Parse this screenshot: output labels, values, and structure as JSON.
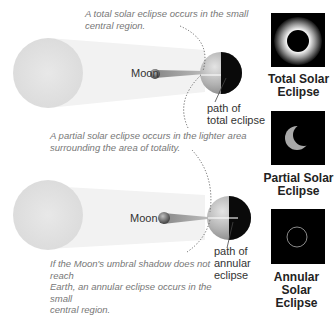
{
  "panels": [
    {
      "id": "total",
      "caption": "A total solar eclipse occurs in the small central region.",
      "caption_lines": [
        "A total solar eclipse occurs in the small",
        "central region."
      ],
      "moon_label": "Moon",
      "path_label_lines": [
        "path of",
        "total eclipse"
      ],
      "photo_title_lines": [
        "Total Solar",
        "Eclipse"
      ]
    },
    {
      "id": "partial",
      "caption": "A partial solar eclipse occurs in the lighter area surrounding the area of totality.",
      "caption_lines": [
        "A partial solar eclipse occurs in the lighter area",
        "surrounding the area of totality."
      ],
      "photo_title_lines": [
        "Partial Solar",
        "Eclipse"
      ]
    },
    {
      "id": "annular",
      "caption": "If the Moon's umbral shadow does not reach Earth, an annular eclipse occurs in the small central region.",
      "caption_lines": [
        "If the Moon's umbral shadow does not reach",
        "Earth, an annular eclipse occurs in the small",
        "central region."
      ],
      "moon_label": "Moon",
      "path_label_lines": [
        "path of",
        "annular",
        "eclipse"
      ],
      "photo_title_lines": [
        "Annular Solar",
        "Eclipse"
      ]
    }
  ],
  "colors": {
    "sun": "#e6e6e6",
    "shadow_beam": "#f3f3f3",
    "earth_lit": "#b8b8b8",
    "earth_dark": "#0a0a0a",
    "photo_bg": "#000000"
  }
}
